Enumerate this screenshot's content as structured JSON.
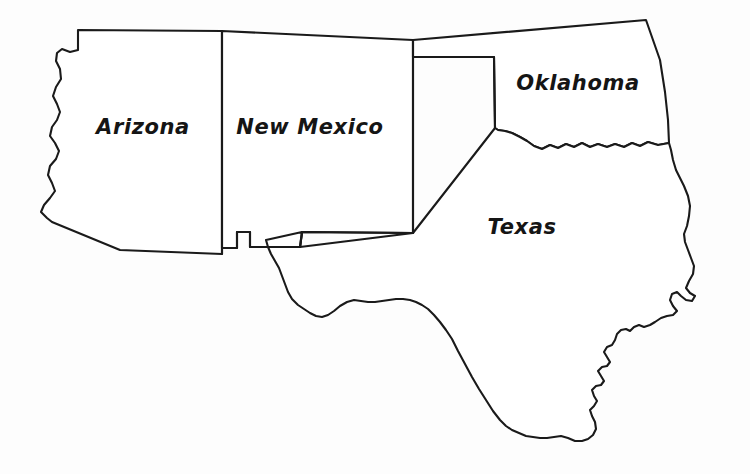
{
  "map": {
    "title": "Southwestern United States Outline Map",
    "style": "hand-drawn ink outline",
    "background_color": "#ffffff",
    "line_color": "#1a1a1a",
    "label_color": "#151515",
    "width": 750,
    "height": 474,
    "states": [
      {
        "id": "arizona",
        "label": "Arizona",
        "label_x": 143,
        "label_y": 128
      },
      {
        "id": "new-mexico",
        "label": "New Mexico",
        "label_x": 310,
        "label_y": 128
      },
      {
        "id": "oklahoma",
        "label": "Oklahoma",
        "label_x": 578,
        "label_y": 84
      },
      {
        "id": "texas",
        "label": "Texas",
        "label_x": 522,
        "label_y": 228
      }
    ]
  }
}
